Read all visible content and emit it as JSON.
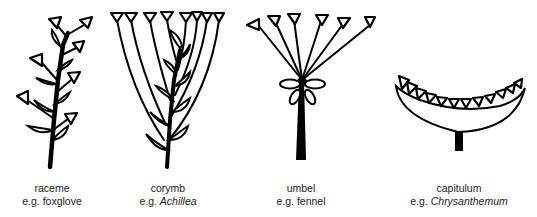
{
  "figure": {
    "inflorescences": [
      {
        "name": "raceme",
        "example_prefix": "e.g.",
        "example": "foxglove",
        "example_italic": false
      },
      {
        "name": "corymb",
        "example_prefix": "e.g.",
        "example": "Achillea",
        "example_italic": true
      },
      {
        "name": "umbel",
        "example_prefix": "e.g.",
        "example": "fennel",
        "example_italic": false
      },
      {
        "name": "capitulum",
        "example_prefix": "e.g.",
        "example": "Chrysanthemum",
        "example_italic": true
      }
    ],
    "colors": {
      "ink": "#000000",
      "background": "#ffffff",
      "caption": "#222222"
    }
  }
}
